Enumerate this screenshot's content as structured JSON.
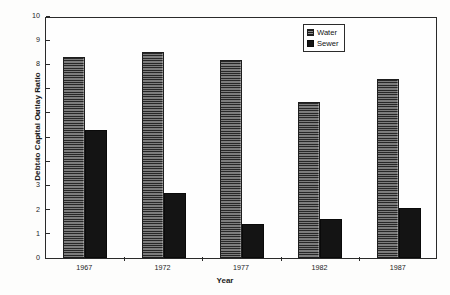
{
  "chart_data": {
    "type": "bar",
    "title": "",
    "xlabel": "Year",
    "ylabel": "Debt to Capital Outlay Ratio",
    "categories": [
      "1967",
      "1972",
      "1977",
      "1982",
      "1987"
    ],
    "series": [
      {
        "name": "Water",
        "values": [
          8.3,
          8.5,
          8.2,
          6.45,
          7.4
        ]
      },
      {
        "name": "Sewer",
        "values": [
          5.3,
          2.7,
          1.4,
          1.6,
          2.05
        ]
      }
    ],
    "ylim": [
      0,
      10
    ],
    "yticks": [
      0,
      1,
      2,
      3,
      4,
      5,
      6,
      7,
      8,
      9,
      10
    ],
    "ytick_labels": [
      "0",
      "1",
      "2",
      "3",
      "4",
      "5",
      "6",
      "7",
      "8",
      "9",
      "10"
    ],
    "grid": false,
    "legend_position": "top-right",
    "colors": {
      "water": "#5e5e5e",
      "sewer": "#141414",
      "axis": "#2a2a2a",
      "background": "#fefefe",
      "text": "#1c1c1c"
    }
  },
  "legend": {
    "items": [
      {
        "label": "Water",
        "key": "water"
      },
      {
        "label": "Sewer",
        "key": "sewer"
      }
    ]
  }
}
